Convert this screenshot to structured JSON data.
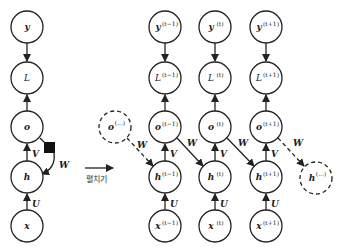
{
  "diagram": {
    "type": "unfolded-rnn-computational-graph",
    "folded": {
      "nodes": {
        "y": "y",
        "L": "L",
        "o": "o",
        "h": "h",
        "x": "x"
      },
      "edge_labels": {
        "U": "U",
        "V": "V",
        "W": "W"
      },
      "delay_marker": "black-square"
    },
    "unfold_label": "펼치기",
    "unfolded": {
      "columns": [
        {
          "sup": "(t−1)",
          "y": "y",
          "L": "L",
          "o": "o",
          "h": "h",
          "x": "x"
        },
        {
          "sup": "(t)",
          "y": "y",
          "L": "L",
          "o": "o",
          "h": "h",
          "x": "x"
        },
        {
          "sup": "(t+1)",
          "y": "y",
          "L": "L",
          "o": "o",
          "h": "h",
          "x": "x"
        }
      ],
      "prev_node": {
        "base": "o",
        "sup": "(...)"
      },
      "next_node": {
        "base": "h",
        "sup": "(...)"
      },
      "edge_labels": {
        "U": "U",
        "V": "V",
        "W": "W"
      }
    },
    "colors": {
      "stroke": "#222222",
      "background": "#ffffff"
    }
  }
}
